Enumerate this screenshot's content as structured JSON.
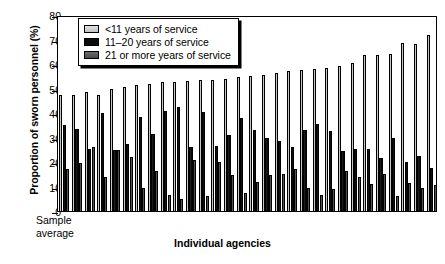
{
  "chart_data": {
    "type": "bar",
    "title": "",
    "xlabel": "Individual agencies",
    "ylabel": "Proportion of sworn personnel (%)",
    "ylim": [
      0,
      80
    ],
    "yticks": [
      0,
      10,
      20,
      30,
      40,
      50,
      60,
      70,
      80
    ],
    "grid": false,
    "legend_position": "top-left",
    "annotations": [
      "Sample average"
    ],
    "categories": [
      "Sample average",
      "A2",
      "A3",
      "A4",
      "A5",
      "A6",
      "A7",
      "A8",
      "A9",
      "A10",
      "A11",
      "A12",
      "A13",
      "A14",
      "A15",
      "A16",
      "A17",
      "A18",
      "A19",
      "A20",
      "A21",
      "A22",
      "A23",
      "A24",
      "A25",
      "A26",
      "A27",
      "A28",
      "A29",
      "A30"
    ],
    "series": [
      {
        "name": "<11 years of service",
        "color": "#c9c9c9",
        "values": [
          47.5,
          47.5,
          48.5,
          47.5,
          50.0,
          50.5,
          51.5,
          52.0,
          52.5,
          52.5,
          53.0,
          53.5,
          53.5,
          54.0,
          54.5,
          55.0,
          55.5,
          56.5,
          57.0,
          57.5,
          58.0,
          58.5,
          59.0,
          60.5,
          63.5,
          63.5,
          64.0,
          68.5,
          68.0,
          72.0
        ]
      },
      {
        "name": "11–20 years of service",
        "color": "#0b0b0b",
        "values": [
          35.0,
          33.5,
          25.5,
          40.0,
          25.0,
          27.5,
          38.5,
          31.5,
          41.0,
          42.5,
          26.0,
          40.5,
          26.5,
          31.0,
          38.0,
          33.0,
          30.0,
          28.5,
          26.0,
          33.0,
          35.5,
          32.5,
          24.5,
          25.5,
          25.5,
          21.5,
          30.0,
          20.0,
          22.5,
          17.5
        ]
      },
      {
        "name": "21 or more years of service",
        "color": "#555555",
        "values": [
          17.0,
          19.5,
          26.0,
          14.0,
          25.0,
          22.0,
          9.5,
          16.5,
          6.5,
          5.0,
          21.0,
          6.0,
          20.0,
          14.5,
          7.5,
          12.0,
          14.5,
          15.0,
          17.0,
          9.5,
          6.5,
          9.0,
          16.5,
          14.0,
          11.0,
          15.0,
          6.0,
          11.5,
          9.5,
          10.5
        ]
      }
    ]
  },
  "legend": {
    "items": [
      {
        "label": "<11 years of service"
      },
      {
        "label": "11–20 years of service"
      },
      {
        "label": "21 or more years of service"
      }
    ]
  },
  "axes": {
    "y_title": "Proportion of sworn personnel (%)",
    "x_title": "Individual agencies",
    "y_ticks": [
      "80",
      "70",
      "60",
      "50",
      "40",
      "30",
      "20",
      "10",
      "0"
    ],
    "sample_average_line1": "Sample",
    "sample_average_line2": "average"
  }
}
